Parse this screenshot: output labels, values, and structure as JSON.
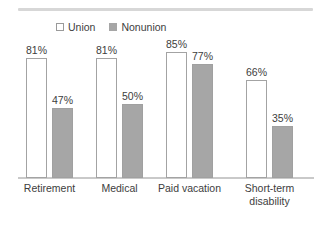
{
  "chart_data": {
    "type": "bar",
    "title": "",
    "subtitle": "",
    "xlabel": "",
    "ylabel": "",
    "ylim": [
      0,
      100
    ],
    "grid": false,
    "legend_position": "top-left",
    "value_suffix": "%",
    "categories": [
      "Retirement",
      "Medical",
      "Paid vacation",
      "Short-term\ndisability"
    ],
    "series": [
      {
        "name": "Union",
        "swatch": "union-swatch",
        "color": "#ffffff",
        "border_color": "#a3a3a3",
        "values": [
          81,
          81,
          85,
          66
        ],
        "labels": [
          "81%",
          "81%",
          "85%",
          "66%"
        ]
      },
      {
        "name": "Nonunion",
        "swatch": "nonunion-swatch",
        "color": "#a6a6a6",
        "border_color": "#a0a0a0",
        "values": [
          47,
          50,
          77,
          35
        ],
        "labels": [
          "47%",
          "50%",
          "77%",
          "35%"
        ]
      }
    ]
  },
  "legend": {
    "items": [
      {
        "label": "Union"
      },
      {
        "label": "Nonunion"
      }
    ]
  },
  "axis": {
    "categories": [
      {
        "line1": "Retirement",
        "line2": ""
      },
      {
        "line1": "Medical",
        "line2": ""
      },
      {
        "line1": "Paid vacation",
        "line2": ""
      },
      {
        "line1": "Short-term",
        "line2": "disability"
      }
    ]
  },
  "colors": {
    "union_fill": "#ffffff",
    "union_border": "#a3a3a3",
    "nonunion_fill": "#a6a6a6",
    "axis": "#c9c9c9",
    "rule": "#d7d7d7",
    "text": "#3d3d3d"
  }
}
